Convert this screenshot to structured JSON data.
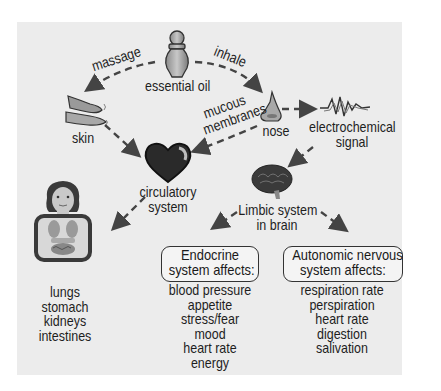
{
  "diagram": {
    "title": "",
    "nodes": {
      "essential_oil": {
        "label": "essential oil"
      },
      "skin": {
        "label": "skin"
      },
      "nose": {
        "label": "nose"
      },
      "electrochemical_signal": {
        "line1": "electrochemical",
        "line2": "signal"
      },
      "circulatory_system": {
        "line1": "circulatory",
        "line2": "system"
      },
      "limbic_system": {
        "line1": "Limbic system",
        "line2": "in brain"
      },
      "organs": {
        "items": [
          "lungs",
          "stomach",
          "kidneys",
          "intestines"
        ]
      },
      "endocrine": {
        "title_line1": "Endocrine",
        "title_line2": "system affects:",
        "items": [
          "blood pressure",
          "appetite",
          "stress/fear",
          "mood",
          "heart rate",
          "energy"
        ]
      },
      "autonomic": {
        "title_line1": "Autonomic nervous",
        "title_line2": "system affects:",
        "items": [
          "respiration rate",
          "perspiration",
          "heart rate",
          "digestion",
          "salivation"
        ]
      }
    },
    "edges": {
      "massage": {
        "label": "massage",
        "from": "essential oil",
        "to": "skin"
      },
      "inhale": {
        "label": "inhale",
        "from": "essential oil",
        "to": "nose"
      },
      "mucous": {
        "line1": "mucous",
        "line2": "membranes",
        "from": "nose",
        "to": "circulatory system"
      },
      "nose_signal": {
        "from": "nose",
        "to": "electrochemical signal"
      },
      "skin_circ": {
        "from": "skin",
        "to": "circulatory system"
      },
      "signal_limbic": {
        "from": "electrochemical signal",
        "to": "limbic system"
      },
      "circ_organs": {
        "from": "circulatory system",
        "to": "organs"
      },
      "limbic_endocrine": {
        "from": "limbic system",
        "to": "endocrine"
      },
      "limbic_autonomic": {
        "from": "limbic system",
        "to": "autonomic"
      }
    },
    "colors": {
      "panel": "#ececec",
      "text": "#1e1e1e",
      "heart": "#2a2a2a",
      "brain": "#3a3a3a",
      "arrow": "#444444"
    }
  }
}
